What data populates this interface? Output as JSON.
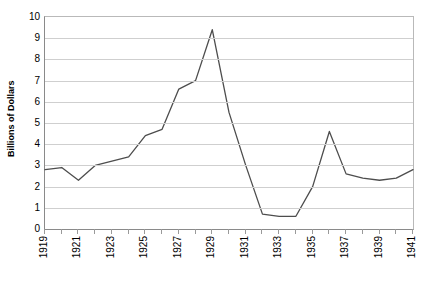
{
  "chart_data": {
    "type": "line",
    "title": "",
    "xlabel": "",
    "ylabel": "Billions of Dollars",
    "ylim": [
      0,
      10
    ],
    "ytick_labels": [
      "10",
      "9",
      "8",
      "7",
      "6",
      "5",
      "4",
      "3",
      "2",
      "1",
      "0"
    ],
    "ytick_values": [
      10,
      9,
      8,
      7,
      6,
      5,
      4,
      3,
      2,
      1,
      0
    ],
    "xlim": [
      1919,
      1941
    ],
    "xtick_labels": [
      "1919",
      "1921",
      "1923",
      "1925",
      "1927",
      "1929",
      "1931",
      "1933",
      "1935",
      "1937",
      "1939",
      "1941"
    ],
    "xtick_values": [
      1919,
      1921,
      1923,
      1925,
      1927,
      1929,
      1931,
      1933,
      1935,
      1937,
      1939,
      1941
    ],
    "grid": true,
    "legend": "none",
    "series": [
      {
        "name": "Gross Private Domestic Investment",
        "color": "#4d4d4d",
        "x": [
          1919,
          1920,
          1921,
          1922,
          1923,
          1924,
          1925,
          1926,
          1927,
          1928,
          1929,
          1930,
          1931,
          1932,
          1933,
          1934,
          1935,
          1936,
          1937,
          1938,
          1939,
          1940,
          1941
        ],
        "values": [
          2.8,
          2.9,
          2.3,
          3.0,
          3.2,
          3.4,
          4.4,
          4.7,
          6.6,
          7.0,
          9.4,
          5.5,
          3.0,
          0.7,
          0.6,
          0.6,
          2.0,
          4.6,
          2.6,
          2.4,
          2.3,
          2.4,
          2.8
        ]
      }
    ],
    "annotations": []
  },
  "axis": {
    "y_title": "Billions of Dollars"
  }
}
